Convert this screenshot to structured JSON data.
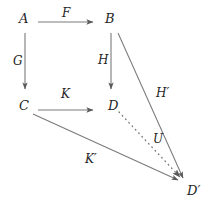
{
  "diagram": {
    "type": "commutative-diagram",
    "background_color": "#ffffff",
    "line_color": "#7a7a7a",
    "text_color": "#262626",
    "nodes": [
      {
        "id": "A",
        "label": "A",
        "x": 24,
        "y": 19
      },
      {
        "id": "B",
        "label": "B",
        "x": 110,
        "y": 19
      },
      {
        "id": "C",
        "label": "C",
        "x": 24,
        "y": 106
      },
      {
        "id": "D",
        "label": "D",
        "x": 113,
        "y": 106
      },
      {
        "id": "Dp",
        "label": "D′",
        "x": 194,
        "y": 191
      }
    ],
    "edges": [
      {
        "id": "F",
        "label": "F",
        "from": "A",
        "to": "B",
        "style": "solid",
        "label_x": 66,
        "label_y": 13,
        "x1": 38,
        "y1": 22,
        "x2": 96,
        "y2": 22
      },
      {
        "id": "G",
        "label": "G",
        "from": "A",
        "to": "C",
        "style": "solid",
        "label_x": 17,
        "label_y": 61,
        "x1": 25,
        "y1": 32,
        "x2": 25,
        "y2": 92
      },
      {
        "id": "H",
        "label": "H",
        "from": "B",
        "to": "D",
        "style": "solid",
        "label_x": 100,
        "label_y": 60,
        "x1": 111,
        "y1": 32,
        "x2": 111,
        "y2": 92
      },
      {
        "id": "K",
        "label": "K",
        "from": "C",
        "to": "D",
        "style": "solid",
        "label_x": 64,
        "label_y": 94,
        "x1": 38,
        "y1": 110,
        "x2": 96,
        "y2": 110
      },
      {
        "id": "Hp",
        "label": "H′",
        "from": "B",
        "to": "Dp",
        "style": "solid",
        "label_x": 158,
        "label_y": 93,
        "x1": 118,
        "y1": 32,
        "x2": 184,
        "y2": 181
      },
      {
        "id": "Kp",
        "label": "K′",
        "from": "C",
        "to": "Dp",
        "style": "solid",
        "label_x": 88,
        "label_y": 159,
        "x1": 33,
        "y1": 114,
        "x2": 180,
        "y2": 182
      },
      {
        "id": "U",
        "label": "U",
        "from": "D",
        "to": "Dp",
        "style": "dotted",
        "label_x": 155,
        "label_y": 139,
        "x1": 118,
        "y1": 111,
        "x2": 182,
        "y2": 180
      }
    ]
  }
}
